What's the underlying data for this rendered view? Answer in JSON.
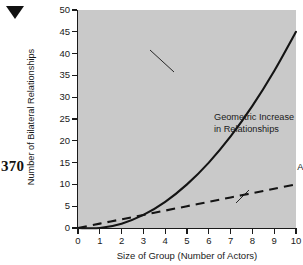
{
  "page": {
    "page_number": "370",
    "marker_icon": "down-triangle-icon"
  },
  "chart_data": {
    "type": "line",
    "title": "",
    "xlabel": "Size of Group (Number of Actors)",
    "ylabel": "Number of Bilateral Relationships",
    "xlim": [
      0,
      10
    ],
    "ylim": [
      0,
      50
    ],
    "xticks": [
      0,
      1,
      2,
      3,
      4,
      5,
      6,
      7,
      8,
      9,
      10
    ],
    "yticks": [
      0,
      5,
      10,
      15,
      20,
      25,
      30,
      35,
      40,
      45,
      50
    ],
    "xtick_labels": [
      "0",
      "1",
      "2",
      "3",
      "4",
      "5",
      "6",
      "7",
      "8",
      "9",
      "10"
    ],
    "ytick_labels": [
      "0",
      "5",
      "10",
      "15",
      "20",
      "25",
      "30",
      "35",
      "40",
      "45",
      "50"
    ],
    "grid": false,
    "legend": "none",
    "plot_background": "#c9c9c9",
    "line_color": "#1a1a1a",
    "series": [
      {
        "name": "Geometric Increase in Relationships",
        "style": "solid",
        "x": [
          0,
          1,
          2,
          3,
          4,
          5,
          6,
          7,
          8,
          9,
          10
        ],
        "values": [
          0,
          0,
          1,
          3,
          6,
          10,
          15,
          21,
          28,
          36,
          45
        ]
      },
      {
        "name": "Arithmetic Increase in Number of Persons",
        "style": "dashed",
        "x": [
          0,
          1,
          2,
          3,
          4,
          5,
          6,
          7,
          8,
          9,
          10
        ],
        "values": [
          0,
          1,
          2,
          3,
          4,
          5,
          6,
          7,
          8,
          9,
          10
        ]
      }
    ],
    "annotations": [
      {
        "name": "geometric",
        "text": "Geometric Increase\nin Relationships",
        "align": "left"
      },
      {
        "name": "arithmetic",
        "text": "Arithmetic Increase\nin Number\nof Persons",
        "align": "right"
      }
    ]
  }
}
